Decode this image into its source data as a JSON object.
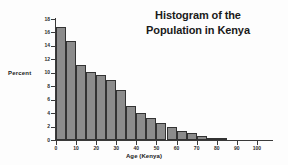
{
  "figure": {
    "background_color": "#fdfdfd",
    "bar_fill_color": "#8c8c8c",
    "bar_edge_color": "#333333",
    "axis_color": "#3a3a3a",
    "text_color": "#1a1a1a"
  },
  "title": {
    "line1": "Histogram of the",
    "line2": "Population in Kenya"
  },
  "axes": {
    "ylabel": "Percent",
    "xlabel": "Age (Kenya)",
    "ytick_labels": [
      "0",
      "2",
      "4",
      "6",
      "8",
      "10",
      "12",
      "14",
      "16",
      "18"
    ],
    "ytick_values": [
      0,
      2,
      4,
      6,
      8,
      10,
      12,
      14,
      16,
      18
    ],
    "xtick_labels": [
      "0",
      "10",
      "20",
      "30",
      "40",
      "50",
      "60",
      "70",
      "80",
      "90",
      "100"
    ],
    "xtick_values": [
      0,
      10,
      20,
      30,
      40,
      50,
      60,
      70,
      80,
      90,
      100
    ]
  },
  "chart_data": {
    "type": "bar",
    "title": "Histogram of the Population in Kenya",
    "xlabel": "Age (Kenya)",
    "ylabel": "Percent",
    "xlim": [
      0,
      107
    ],
    "ylim": [
      0,
      18
    ],
    "grid": false,
    "legend": null,
    "bin_width": 5,
    "categories": [
      "0-5",
      "5-10",
      "10-15",
      "15-20",
      "20-25",
      "25-30",
      "30-35",
      "35-40",
      "40-45",
      "45-50",
      "50-55",
      "55-60",
      "60-65",
      "65-70",
      "70-75",
      "75-80",
      "80-85"
    ],
    "bin_edges": [
      0,
      5,
      10,
      15,
      20,
      25,
      30,
      35,
      40,
      45,
      50,
      55,
      60,
      65,
      70,
      75,
      80,
      85
    ],
    "values": [
      16.8,
      14.7,
      11.1,
      10.1,
      9.7,
      9.0,
      7.4,
      5.1,
      4.0,
      3.3,
      2.5,
      1.9,
      1.4,
      1.0,
      0.6,
      0.3,
      0.15
    ]
  }
}
